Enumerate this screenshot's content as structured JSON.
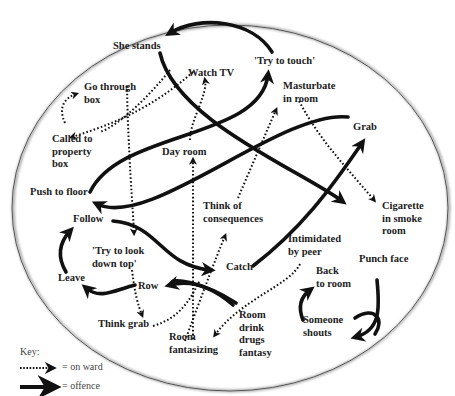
{
  "header": {
    "page_number": "51"
  },
  "nodes": {
    "she_stands": "She stands",
    "try_to_touch": "'Try to touch'",
    "go_through_box": "Go through\nbox",
    "watch_tv": "Watch TV",
    "masturbate": "Masturbate\nin room",
    "called_to_property_box": "Called to\nproperty\nbox",
    "grab": "Grab",
    "day_room": "Day room",
    "push_to_floor": "Push to floor",
    "think_of_consequences": "Think of\nconsequences",
    "cigarette": "Cigarette\nin smoke\nroom",
    "follow": "Follow",
    "try_to_look": "'Try to look\ndown top'",
    "catch": "Catch",
    "intimidated": "Intimidated\nby peer",
    "punch_face": "Punch face",
    "leave": "Leave",
    "row": "Row",
    "back_to_room": "Back\nto room",
    "think_grab": "Think grab",
    "room_fantasizing": "Room\nfantasizing",
    "room_drink": "Room\ndrink\ndrugs\nfantasy",
    "someone_shouts": "Someone\nshouts"
  },
  "legend": {
    "title": "Key:",
    "items": [
      {
        "style": "dotted",
        "label": "= on ward"
      },
      {
        "style": "solid",
        "label": "= offence"
      }
    ]
  }
}
